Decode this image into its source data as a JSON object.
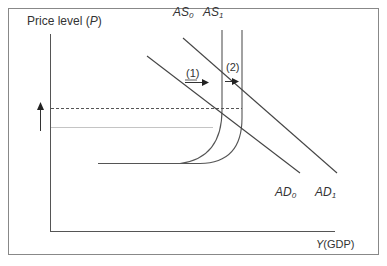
{
  "diagram": {
    "type": "economics-AS-AD",
    "y_axis_label": {
      "prefix": "Price level (",
      "var": "P",
      "suffix": ")"
    },
    "x_axis_label": {
      "var": "Y",
      "suffix": "(GDP)"
    },
    "curves": {
      "as0": {
        "base": "AS",
        "sub": "0"
      },
      "as1": {
        "base": "AS",
        "sub": "1"
      },
      "ad0": {
        "base": "AD",
        "sub": "0"
      },
      "ad1": {
        "base": "AD",
        "sub": "1"
      }
    },
    "shift_labels": {
      "shift1": "(1)",
      "shift2": "(2)"
    },
    "colors": {
      "line": "#444444",
      "frame": "#777777",
      "dashed": "#555555",
      "light_line": "#bbbbbb"
    }
  }
}
